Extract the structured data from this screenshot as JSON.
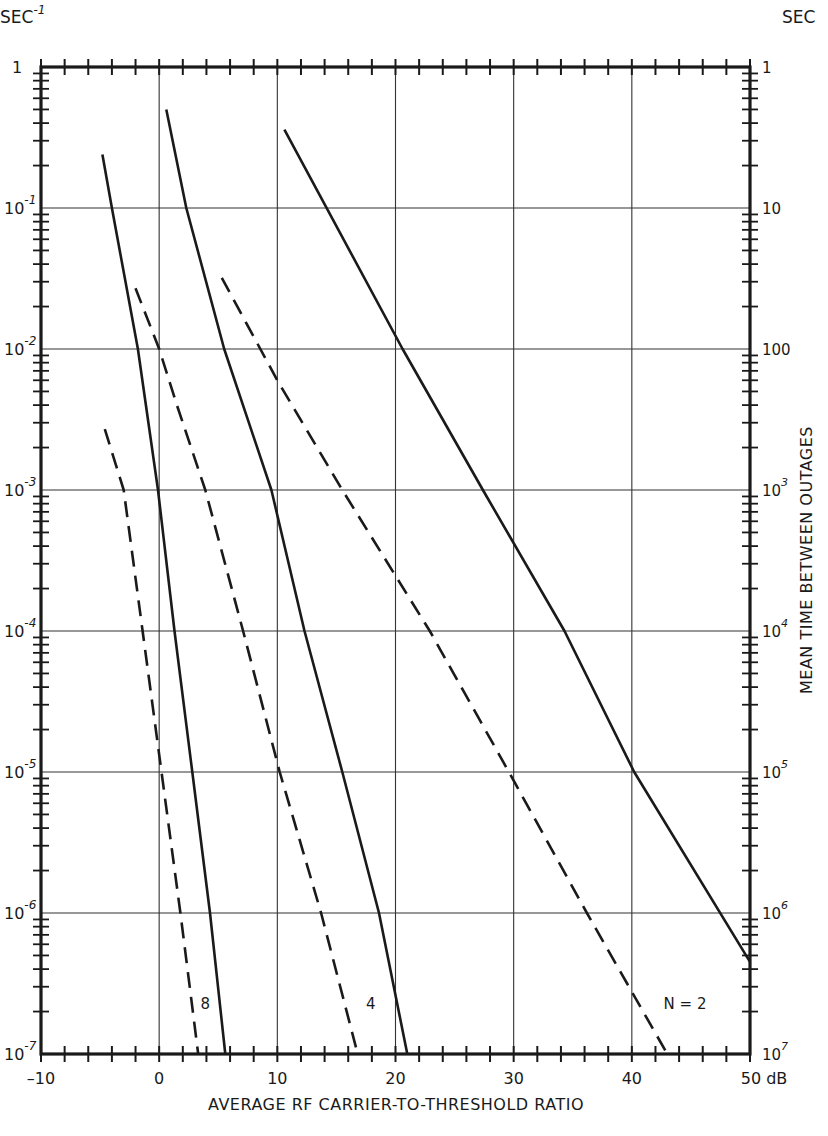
{
  "chart_data": {
    "type": "line",
    "title": "",
    "xlabel": "AVERAGE RF CARRIER-TO-THRESHOLD RATIO",
    "ylabel_left_unit": "SEC-1",
    "ylabel_right": "MEAN TIME BETWEEN OUTAGES",
    "ylabel_right_unit": "SEC",
    "xlim": [
      -10,
      50
    ],
    "x_unit": "dB",
    "ylim": [
      1e-07,
      1
    ],
    "yscale": "log",
    "grid": true,
    "x_ticks": [
      -10,
      0,
      10,
      20,
      30,
      40,
      50
    ],
    "x_tick_labels": [
      "-10",
      "0",
      "10",
      "20",
      "30",
      "40",
      "50 dB"
    ],
    "y_left_ticks": [
      1,
      0.1,
      0.01,
      0.001,
      0.0001,
      1e-05,
      1e-06,
      1e-07
    ],
    "y_left_tick_labels": [
      [
        "1",
        ""
      ],
      [
        "10",
        "-1"
      ],
      [
        "10",
        "-2"
      ],
      [
        "10",
        "-3"
      ],
      [
        "10",
        "-4"
      ],
      [
        "10",
        "-5"
      ],
      [
        "10",
        "-6"
      ],
      [
        "10",
        "-7"
      ]
    ],
    "y_right_tick_labels": [
      [
        "1",
        ""
      ],
      [
        "10",
        ""
      ],
      [
        "100",
        ""
      ],
      [
        "10",
        "3"
      ],
      [
        "10",
        "4"
      ],
      [
        "10",
        "5"
      ],
      [
        "10",
        "6"
      ],
      [
        "10",
        "7"
      ]
    ],
    "series": [
      {
        "name": "N=2 (solid)",
        "style": "solid",
        "x": [
          10.6,
          20.6,
          27.4,
          34.3,
          40.2,
          50.0
        ],
        "y": [
          0.36,
          0.01,
          0.001,
          0.0001,
          1e-05,
          4.5e-07
        ]
      },
      {
        "name": "N=2 (dashed)",
        "style": "dashed",
        "x": [
          5.3,
          10.0,
          15.5,
          22.9,
          29.6,
          36.2,
          43.0
        ],
        "y": [
          0.032,
          0.006,
          0.001,
          0.0001,
          1e-05,
          1e-06,
          1e-07
        ]
      },
      {
        "name": "N=4 (solid)",
        "style": "solid",
        "x": [
          0.6,
          2.3,
          5.5,
          9.5,
          12.3,
          15.5,
          18.6,
          21.0
        ],
        "y": [
          0.5,
          0.1,
          0.01,
          0.001,
          0.0001,
          1e-05,
          1e-06,
          1e-07
        ]
      },
      {
        "name": "N=4 (dashed)",
        "style": "dashed",
        "x": [
          -2.0,
          0.0,
          1.5,
          3.9,
          7.1,
          10.2,
          13.7,
          16.8
        ],
        "y": [
          0.027,
          0.01,
          0.004,
          0.001,
          0.0001,
          1e-05,
          1e-06,
          1e-07
        ]
      },
      {
        "name": "N=8 (solid)",
        "style": "solid",
        "x": [
          -4.8,
          -4.0,
          -1.8,
          -0.1,
          1.3,
          2.8,
          4.3,
          5.6
        ],
        "y": [
          0.24,
          0.1,
          0.01,
          0.001,
          0.0001,
          1e-05,
          1e-06,
          1e-07
        ]
      },
      {
        "name": "N=8 (dashed)",
        "style": "dashed",
        "x": [
          -4.6,
          -3.0,
          -1.4,
          0.2,
          1.8,
          3.3
        ],
        "y": [
          0.0027,
          0.001,
          0.0001,
          1e-05,
          1e-06,
          1e-07
        ]
      }
    ],
    "annotations": [
      {
        "text": "8",
        "x": 3.9,
        "y": 2.3e-07
      },
      {
        "text": "4",
        "x": 17.9,
        "y": 2.3e-07
      },
      {
        "text": "N = 2",
        "x": 44.5,
        "y": 2.3e-07
      }
    ]
  },
  "labels": {
    "left_unit_base": "SEC",
    "left_unit_exp": "-1",
    "right_unit": "SEC",
    "xlabel": "AVERAGE  RF  CARRIER-TO-THRESHOLD  RATIO",
    "ylabel_right": "MEAN  TIME  BETWEEN  OUTAGES"
  }
}
